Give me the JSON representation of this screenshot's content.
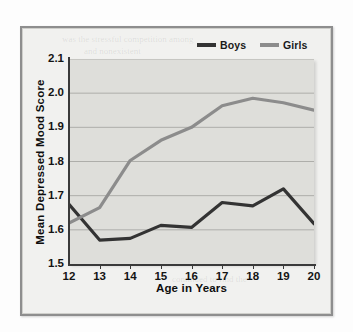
{
  "chart_data": {
    "type": "line",
    "title": "",
    "xlabel": "Age in Years",
    "ylabel": "Mean Depressed Mood Score",
    "x": [
      12,
      13,
      14,
      15,
      16,
      17,
      18,
      19,
      20
    ],
    "xtick_labels": [
      "12",
      "13",
      "14",
      "15",
      "16",
      "17",
      "18",
      "19",
      "20"
    ],
    "ytick_labels": [
      "2.1",
      "2.0",
      "1.9",
      "1.8",
      "1.7",
      "1.6",
      "1.5"
    ],
    "ytick_values": [
      2.1,
      2.0,
      1.9,
      1.8,
      1.7,
      1.6,
      1.5
    ],
    "xlim": [
      12,
      20
    ],
    "ylim": [
      1.5,
      2.1
    ],
    "grid": "horizontal",
    "legend_position": "top-right",
    "series": [
      {
        "name": "Boys",
        "color": "#333333",
        "values": [
          1.675,
          1.57,
          1.575,
          1.613,
          1.607,
          1.68,
          1.67,
          1.72,
          1.618
        ]
      },
      {
        "name": "Girls",
        "color": "#8c8c8c",
        "values": [
          1.62,
          1.665,
          1.803,
          1.862,
          1.9,
          1.963,
          1.985,
          1.972,
          1.95
        ]
      }
    ]
  },
  "legend": {
    "entries": [
      {
        "label": "Boys",
        "color": "#333333"
      },
      {
        "label": "Girls",
        "color": "#8c8c8c"
      }
    ]
  },
  "axes": {
    "y_title": "Mean Depressed Mood Score",
    "x_title": "Age in Years"
  },
  "colors": {
    "plot_background": "#dededa",
    "figure_background": "#f1f1ef",
    "frame_border": "#8e8e8e",
    "gridline": "#aeaeaa",
    "axis": "#3a3a3a",
    "boys_line": "#333333",
    "girls_line": "#8c8c8c"
  },
  "background_text": {
    "lines": [
      "was the stressful competition among",
      "and nonexistent",
      "as a whole of the mood",
      "that there was the period",
      "among the relationship of",
      "the trend the adolescent",
      "continued to find the"
    ]
  }
}
